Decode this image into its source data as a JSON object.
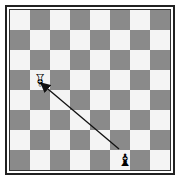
{
  "board": {
    "size": 8,
    "top_left_color": "light",
    "colors": {
      "light": "#f4f4f4",
      "dark": "#8a8a8a",
      "border": "#222222"
    },
    "pieces": [
      {
        "name": "white-bishop-inverted",
        "glyph": "♗",
        "square": "b5",
        "col": 1,
        "row": 3,
        "rotated": true,
        "color": "#111111"
      },
      {
        "name": "black-bishop",
        "glyph": "♝",
        "square": "f1",
        "col": 5,
        "row": 7,
        "rotated": false,
        "color": "#111111"
      }
    ],
    "arrow": {
      "from": "f1",
      "to": "b5",
      "color": "#111111"
    }
  }
}
